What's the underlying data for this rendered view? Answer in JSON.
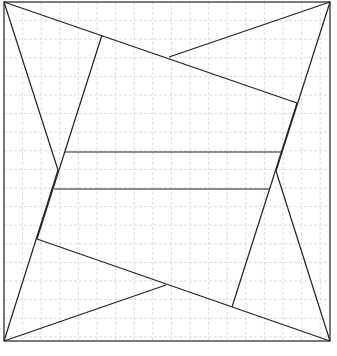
{
  "diagram": {
    "width": 337,
    "height": 356,
    "frame": {
      "x": 4,
      "y": 2,
      "w": 326,
      "h": 339
    },
    "grid": {
      "step": 18.6,
      "color": "#d6d6d6",
      "dash": "3,2"
    },
    "stroke": {
      "color": "#222222",
      "width": 1.2
    },
    "points": {
      "TL": [
        4,
        2
      ],
      "TR": [
        330,
        2
      ],
      "BR": [
        330,
        341
      ],
      "BL": [
        4,
        341
      ],
      "A": [
        102,
        35
      ],
      "B": [
        297,
        103
      ],
      "C": [
        232,
        307
      ],
      "D": [
        37,
        239
      ],
      "E": [
        169,
        57
      ],
      "F": [
        166,
        285
      ],
      "G": [
        58,
        170
      ],
      "H": [
        276,
        171
      ],
      "I": [
        65,
        152
      ],
      "J": [
        282,
        152
      ],
      "K": [
        54,
        189
      ],
      "L": [
        270,
        189
      ]
    },
    "segments": [
      [
        "TL",
        "B"
      ],
      [
        "TR",
        "E"
      ],
      [
        "A",
        "D"
      ],
      [
        "B",
        "C"
      ],
      [
        "D",
        "BR"
      ],
      [
        "BL",
        "F"
      ],
      [
        "TL",
        "G"
      ],
      [
        "TR",
        "H"
      ],
      [
        "G",
        "BL"
      ],
      [
        "H",
        "BR"
      ],
      [
        "I",
        "J"
      ],
      [
        "K",
        "L"
      ]
    ]
  }
}
